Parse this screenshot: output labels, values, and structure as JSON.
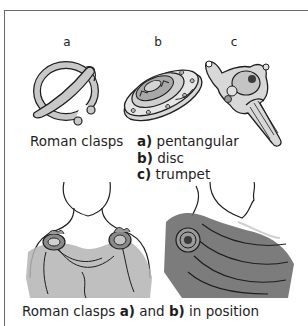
{
  "figure": {
    "letters": {
      "a": "a",
      "b": "b",
      "c": "c"
    },
    "caption_top": {
      "prefix": "Roman clasps",
      "items": [
        {
          "marker": "a)",
          "label": "pentangular"
        },
        {
          "marker": "b)",
          "label": "disc"
        },
        {
          "marker": "c)",
          "label": "trumpet"
        }
      ]
    },
    "caption_bottom": {
      "prefix": "Roman clasps ",
      "marker_a": "a)",
      "mid": " and ",
      "marker_b": "b)",
      "suffix": " in position"
    },
    "illustrations": [
      {
        "id": "clasp-a",
        "icon": "penannular-clasp-icon"
      },
      {
        "id": "clasp-b",
        "icon": "disc-clasp-icon"
      },
      {
        "id": "clasp-c",
        "icon": "trumpet-clasp-icon"
      },
      {
        "id": "bust-front",
        "icon": "bust-front-with-clasps"
      },
      {
        "id": "bust-side",
        "icon": "bust-side-with-disc-clasp"
      }
    ],
    "colors": {
      "frame": "#6a6a6a",
      "ink": "#1e1e1e",
      "metal": "#c8c8c8",
      "cloth_light": "#b4b4b4",
      "cloth_dark": "#6e6e6e"
    }
  }
}
